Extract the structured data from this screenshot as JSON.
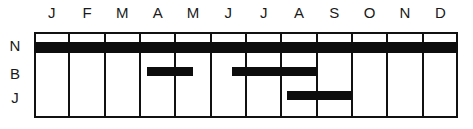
{
  "chart_data": {
    "type": "gantt",
    "title": "",
    "xlabel": "",
    "ylabel": "",
    "categories": [
      "J",
      "F",
      "M",
      "A",
      "M",
      "J",
      "J",
      "A",
      "S",
      "O",
      "N",
      "D"
    ],
    "rows": [
      "N",
      "B",
      "J"
    ],
    "series": [
      {
        "name": "N",
        "bars": [
          {
            "start": 0.0,
            "end": 12.0
          }
        ]
      },
      {
        "name": "B",
        "bars": [
          {
            "start": 3.2,
            "end": 4.5
          },
          {
            "start": 5.6,
            "end": 8.0
          }
        ]
      },
      {
        "name": "J",
        "bars": [
          {
            "start": 7.15,
            "end": 9.0
          }
        ]
      }
    ],
    "x_range": [
      0,
      12
    ],
    "x_unit": "months (Jan–Dec)",
    "grid": "vertical lines at month boundaries",
    "legend": "none",
    "bar_color": "#0d0d0d"
  },
  "labels": {
    "months": [
      "J",
      "F",
      "M",
      "A",
      "M",
      "J",
      "J",
      "A",
      "S",
      "O",
      "N",
      "D"
    ],
    "rows": [
      "N",
      "B",
      "J"
    ]
  }
}
